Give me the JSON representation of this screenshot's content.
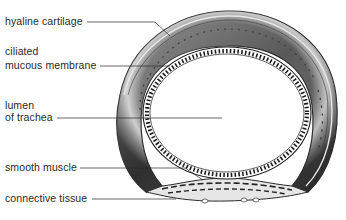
{
  "diagram": {
    "labels": [
      {
        "id": "hyaline-cartilage",
        "lines": [
          "hyaline cartilage"
        ]
      },
      {
        "id": "ciliated-mucous-membrane",
        "lines": [
          "ciliated",
          "mucous membrane"
        ]
      },
      {
        "id": "lumen-of-trachea",
        "lines": [
          "lumen",
          "of trachea"
        ]
      },
      {
        "id": "smooth-muscle",
        "lines": [
          "smooth muscle"
        ]
      },
      {
        "id": "connective-tissue",
        "lines": [
          "connective tissue"
        ]
      }
    ],
    "colors": {
      "ink": "#2a2a2a",
      "cartilage_dark": "#3a3a3a",
      "cartilage_mid": "#8a8a8a",
      "cartilage_light": "#d8d8d8",
      "background": "#ffffff"
    }
  }
}
